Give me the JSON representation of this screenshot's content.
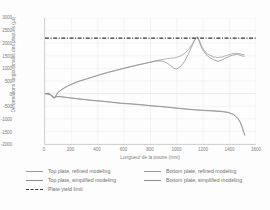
{
  "chart_data": {
    "type": "line",
    "title": "",
    "xlabel": "Longueur de la poutre (mm)",
    "ylabel": "Déformations longitudinales des plaques (µε)",
    "xlim": [
      0,
      1600
    ],
    "ylim": [
      -2000,
      3000
    ],
    "xticks": [
      0,
      200,
      400,
      600,
      800,
      1000,
      1200,
      1400,
      1600
    ],
    "yticks": [
      3000,
      2500,
      2000,
      1500,
      1000,
      500,
      0,
      -500,
      -1000,
      -1500,
      -2000
    ],
    "grid": true,
    "legend_position": "bottom",
    "series": [
      {
        "name": "Top plate, refined modeling",
        "color": "#9a9a9a",
        "style": "solid",
        "x": [
          0,
          30,
          55,
          70,
          85,
          100,
          130,
          170,
          210,
          260,
          310,
          360,
          420,
          480,
          540,
          600,
          660,
          720,
          780,
          840,
          880,
          920,
          950,
          980,
          1000,
          1030,
          1060,
          1090,
          1120,
          1140,
          1155,
          1170,
          1190,
          1220,
          1250,
          1280,
          1310,
          1340,
          1380,
          1420,
          1460,
          1490,
          1510
        ],
        "y": [
          0,
          20,
          -120,
          -180,
          -60,
          60,
          180,
          300,
          400,
          500,
          580,
          660,
          760,
          850,
          930,
          1010,
          1090,
          1160,
          1230,
          1300,
          1340,
          1380,
          1400,
          1420,
          1440,
          1500,
          1600,
          1760,
          2000,
          2180,
          2250,
          2120,
          1850,
          1620,
          1520,
          1460,
          1430,
          1450,
          1520,
          1580,
          1600,
          1560,
          1540
        ]
      },
      {
        "name": "Top plate, simplified modeling",
        "color": "#8c8c8c",
        "style": "solid",
        "x": [
          0,
          30,
          55,
          70,
          85,
          100,
          130,
          170,
          210,
          260,
          310,
          360,
          420,
          480,
          540,
          600,
          660,
          720,
          780,
          840,
          880,
          920,
          950,
          980,
          1000,
          1030,
          1060,
          1090,
          1120,
          1140,
          1155,
          1170,
          1190,
          1220,
          1250,
          1280,
          1310,
          1340,
          1380,
          1420,
          1460,
          1490,
          1510
        ],
        "y": [
          0,
          10,
          -130,
          -190,
          -70,
          50,
          170,
          290,
          390,
          490,
          570,
          650,
          750,
          840,
          920,
          1000,
          1080,
          1150,
          1220,
          1290,
          1300,
          1230,
          1120,
          1000,
          980,
          1080,
          1300,
          1600,
          1950,
          2170,
          2240,
          2060,
          1780,
          1560,
          1420,
          1340,
          1280,
          1330,
          1440,
          1520,
          1560,
          1500,
          1480
        ]
      },
      {
        "name": "Bottom plate, refined modeling",
        "color": "#9a9a9a",
        "style": "solid",
        "x": [
          0,
          40,
          70,
          90,
          120,
          170,
          230,
          300,
          370,
          440,
          510,
          580,
          650,
          720,
          790,
          860,
          930,
          1000,
          1070,
          1140,
          1210,
          1280,
          1340,
          1390,
          1430,
          1460,
          1480,
          1495,
          1505,
          1515
        ],
        "y": [
          0,
          -30,
          -150,
          -110,
          -120,
          -150,
          -190,
          -230,
          -270,
          -300,
          -340,
          -380,
          -400,
          -430,
          -470,
          -500,
          -530,
          -570,
          -610,
          -640,
          -660,
          -680,
          -700,
          -740,
          -820,
          -960,
          -1120,
          -1320,
          -1500,
          -1640
        ]
      },
      {
        "name": "Bottom plate, simplified modeling",
        "color": "#8c8c8c",
        "style": "solid",
        "x": [
          0,
          40,
          70,
          90,
          120,
          170,
          230,
          300,
          370,
          440,
          510,
          580,
          650,
          720,
          790,
          860,
          930,
          1000,
          1070,
          1140,
          1210,
          1280,
          1340,
          1390,
          1430,
          1460,
          1480,
          1495,
          1505,
          1515
        ],
        "y": [
          0,
          -40,
          -160,
          -120,
          -130,
          -160,
          -200,
          -240,
          -280,
          -310,
          -350,
          -390,
          -415,
          -445,
          -480,
          -515,
          -545,
          -585,
          -620,
          -650,
          -675,
          -695,
          -715,
          -755,
          -835,
          -975,
          -1135,
          -1335,
          -1515,
          -1655
        ]
      }
    ],
    "reference_lines": [
      {
        "name": "Plate yield limit",
        "value": 2200,
        "color": "#333333",
        "style": "dashdot",
        "orientation": "horizontal"
      }
    ]
  },
  "legend": {
    "rows": [
      [
        {
          "label": "Top plate, refined modeling",
          "style": "solid",
          "color": "#9a9a9a"
        },
        {
          "label": "Bottom plate, refined modeling",
          "style": "solid",
          "color": "#9a9a9a"
        }
      ],
      [
        {
          "label": "Top plate, simplified modeling",
          "style": "solid",
          "color": "#8c8c8c"
        },
        {
          "label": "Bottom plate, simplified modeling",
          "style": "solid",
          "color": "#8c8c8c"
        }
      ],
      [
        {
          "label": "Plate yield limit",
          "style": "dashdot",
          "color": "#333333"
        }
      ]
    ]
  },
  "colors": {
    "axis": "#d2d2d2",
    "grid": "#ebebeb",
    "tick_text": "#808080",
    "background": "#fdfdfd"
  }
}
